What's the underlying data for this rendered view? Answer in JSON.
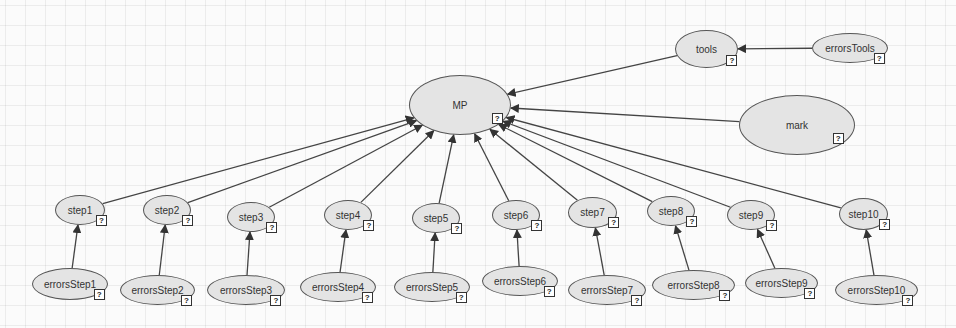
{
  "diagram": {
    "type": "directed-graph",
    "colors": {
      "node_fill": "#e4e4e4",
      "node_stroke": "#555555",
      "edge": "#444444",
      "grid": "#e8e8e8"
    },
    "badge_glyph": "?",
    "nodes": [
      {
        "id": "MP",
        "label": "MP",
        "x": 409,
        "y": 75,
        "w": 102,
        "h": 60
      },
      {
        "id": "tools",
        "label": "tools",
        "x": 675,
        "y": 30,
        "w": 63,
        "h": 38
      },
      {
        "id": "errorsTools",
        "label": "errorsTools",
        "x": 812,
        "y": 33,
        "w": 76,
        "h": 30
      },
      {
        "id": "mark",
        "label": "mark",
        "x": 739,
        "y": 95,
        "w": 116,
        "h": 60
      },
      {
        "id": "step1",
        "label": "step1",
        "x": 55,
        "y": 195,
        "w": 50,
        "h": 30
      },
      {
        "id": "step2",
        "label": "step2",
        "x": 143,
        "y": 195,
        "w": 48,
        "h": 30
      },
      {
        "id": "step3",
        "label": "step3",
        "x": 227,
        "y": 202,
        "w": 48,
        "h": 30
      },
      {
        "id": "step4",
        "label": "step4",
        "x": 324,
        "y": 200,
        "w": 48,
        "h": 30
      },
      {
        "id": "step5",
        "label": "step5",
        "x": 412,
        "y": 203,
        "w": 48,
        "h": 30
      },
      {
        "id": "step6",
        "label": "step6",
        "x": 492,
        "y": 200,
        "w": 48,
        "h": 30
      },
      {
        "id": "step7",
        "label": "step7",
        "x": 568,
        "y": 197,
        "w": 49,
        "h": 31
      },
      {
        "id": "step8",
        "label": "step8",
        "x": 647,
        "y": 196,
        "w": 48,
        "h": 30
      },
      {
        "id": "step9",
        "label": "step9",
        "x": 727,
        "y": 200,
        "w": 48,
        "h": 30
      },
      {
        "id": "step10",
        "label": "step10",
        "x": 839,
        "y": 198,
        "w": 49,
        "h": 32
      },
      {
        "id": "errorsStep1",
        "label": "errorsStep1",
        "x": 32,
        "y": 268,
        "w": 76,
        "h": 32
      },
      {
        "id": "errorsStep2",
        "label": "errorsStep2",
        "x": 120,
        "y": 275,
        "w": 75,
        "h": 30
      },
      {
        "id": "errorsStep3",
        "label": "errorsStep3",
        "x": 207,
        "y": 275,
        "w": 78,
        "h": 30
      },
      {
        "id": "errorsStep4",
        "label": "errorsStep4",
        "x": 300,
        "y": 272,
        "w": 76,
        "h": 30
      },
      {
        "id": "errorsStep5",
        "label": "errorsStep5",
        "x": 394,
        "y": 272,
        "w": 76,
        "h": 30
      },
      {
        "id": "errorsStep6",
        "label": "errorsStep6",
        "x": 482,
        "y": 266,
        "w": 76,
        "h": 30
      },
      {
        "id": "errorsStep7",
        "label": "errorsStep7",
        "x": 568,
        "y": 275,
        "w": 78,
        "h": 30
      },
      {
        "id": "errorsStep8",
        "label": "errorsStep8",
        "x": 652,
        "y": 270,
        "w": 83,
        "h": 30
      },
      {
        "id": "errorsStep9",
        "label": "errorsStep9",
        "x": 745,
        "y": 268,
        "w": 73,
        "h": 30
      },
      {
        "id": "errorsStep10",
        "label": "errorsStep10",
        "x": 835,
        "y": 275,
        "w": 83,
        "h": 30
      }
    ],
    "edges": [
      {
        "from": "errorsTools",
        "to": "tools"
      },
      {
        "from": "tools",
        "to": "MP"
      },
      {
        "from": "mark",
        "to": "MP"
      },
      {
        "from": "step1",
        "to": "MP"
      },
      {
        "from": "step2",
        "to": "MP"
      },
      {
        "from": "step3",
        "to": "MP"
      },
      {
        "from": "step4",
        "to": "MP"
      },
      {
        "from": "step5",
        "to": "MP"
      },
      {
        "from": "step6",
        "to": "MP"
      },
      {
        "from": "step7",
        "to": "MP"
      },
      {
        "from": "step8",
        "to": "MP"
      },
      {
        "from": "step9",
        "to": "MP"
      },
      {
        "from": "step10",
        "to": "MP"
      },
      {
        "from": "errorsStep1",
        "to": "step1"
      },
      {
        "from": "errorsStep2",
        "to": "step2"
      },
      {
        "from": "errorsStep3",
        "to": "step3"
      },
      {
        "from": "errorsStep4",
        "to": "step4"
      },
      {
        "from": "errorsStep5",
        "to": "step5"
      },
      {
        "from": "errorsStep6",
        "to": "step6"
      },
      {
        "from": "errorsStep7",
        "to": "step7"
      },
      {
        "from": "errorsStep8",
        "to": "step8"
      },
      {
        "from": "errorsStep9",
        "to": "step9"
      },
      {
        "from": "errorsStep10",
        "to": "step10"
      }
    ]
  }
}
